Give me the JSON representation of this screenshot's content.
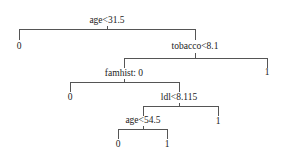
{
  "diagram": {
    "type": "decision-tree",
    "nodes": {
      "root": {
        "label": "age<31.5"
      },
      "root_left_leaf": {
        "label": "0"
      },
      "tobacco": {
        "label": "tobacco<8.1"
      },
      "tobacco_right_leaf": {
        "label": "1"
      },
      "famhist": {
        "label": "famhist: 0"
      },
      "famhist_left_leaf": {
        "label": "0"
      },
      "ldl": {
        "label": "ldl<8.115"
      },
      "ldl_right_leaf": {
        "label": "1"
      },
      "age2": {
        "label": "age<54.5"
      },
      "age2_left_leaf": {
        "label": "0"
      },
      "age2_right_leaf": {
        "label": "1"
      }
    }
  }
}
